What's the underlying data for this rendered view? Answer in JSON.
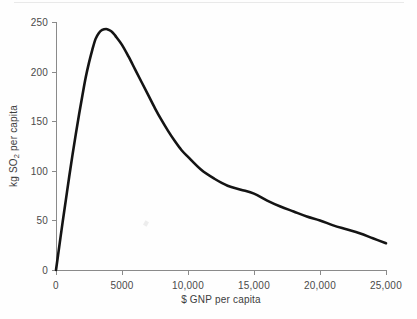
{
  "chart_data": {
    "type": "line",
    "title": "",
    "subtitle": "",
    "xlabel": "$ GNP per capita",
    "ylabel_parts": {
      "prefix": "kg SO",
      "sub": "2",
      "suffix": " per capita"
    },
    "ylabel_plain": "kg SO2 per capita",
    "xlim": [
      0,
      25000
    ],
    "ylim": [
      0,
      250
    ],
    "xticks": [
      0,
      5000,
      10000,
      15000,
      20000,
      25000
    ],
    "xtick_labels": [
      "0",
      "5000",
      "10,000",
      "15,000",
      "20,000",
      "25,000"
    ],
    "yticks": [
      0,
      50,
      100,
      150,
      200,
      250
    ],
    "ytick_labels": [
      "0",
      "50",
      "100",
      "150",
      "200",
      "250"
    ],
    "grid": false,
    "legend": "none",
    "series": [
      {
        "name": "SO2 per capita",
        "color": "#141414",
        "x": [
          0,
          250,
          500,
          750,
          1000,
          1250,
          1500,
          1750,
          2000,
          2250,
          2500,
          2750,
          3000,
          3250,
          3500,
          3800,
          4000,
          4250,
          4500,
          5000,
          5500,
          6000,
          6500,
          7000,
          7500,
          8000,
          8500,
          9000,
          9500,
          10000,
          11000,
          12000,
          13000,
          14000,
          15000,
          16000,
          17000,
          18000,
          19000,
          20000,
          21000,
          22000,
          23000,
          24000,
          25000
        ],
        "y": [
          0,
          24,
          48,
          71,
          94,
          116,
          137,
          157,
          176,
          194,
          209,
          222,
          233,
          239,
          242,
          243,
          242,
          240,
          236,
          227,
          215,
          202,
          189,
          176,
          163,
          151,
          140,
          130,
          121,
          114,
          101,
          92,
          85,
          81,
          77,
          70,
          64,
          59,
          54,
          50,
          45,
          41,
          37,
          32,
          27
        ]
      }
    ],
    "annotations": {
      "peak_x": 3800,
      "peak_y": 243,
      "start_y": 0,
      "end_y": 27
    }
  },
  "axes": {
    "plot_left_px": 56,
    "plot_right_px": 386,
    "plot_top_px": 22,
    "plot_bottom_px": 270
  }
}
